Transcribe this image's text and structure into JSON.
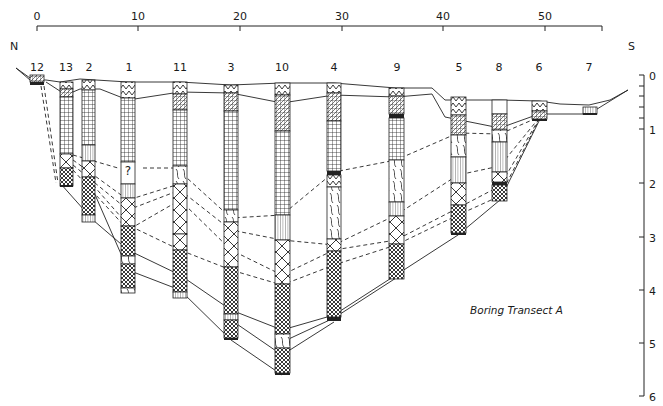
{
  "title": "Boring Transect A",
  "directions": {
    "north": "N",
    "south": "S"
  },
  "distance_scale": {
    "ticks": [
      {
        "label": "0",
        "x": 37
      },
      {
        "label": "10",
        "x": 138
      },
      {
        "label": "20",
        "x": 240
      },
      {
        "label": "30",
        "x": 342
      },
      {
        "label": "40",
        "x": 443
      },
      {
        "label": "50",
        "x": 545
      }
    ],
    "end_x": 602
  },
  "depth_scale": {
    "ticks": [
      {
        "label": "0",
        "y": 75
      },
      {
        "label": "1",
        "y": 129
      },
      {
        "label": "2",
        "y": 183
      },
      {
        "label": "3",
        "y": 237
      },
      {
        "label": "4",
        "y": 290
      },
      {
        "label": "5",
        "y": 343
      },
      {
        "label": "6",
        "y": 396
      }
    ]
  },
  "borings": [
    {
      "id": "12",
      "x": 37,
      "top": 75,
      "bottom": 87,
      "label_x": 37
    },
    {
      "id": "13",
      "x": 66,
      "top": 82,
      "bottom": 187,
      "label_x": 66
    },
    {
      "id": "2",
      "x": 88,
      "top": 80,
      "bottom": 222,
      "label_x": 89
    },
    {
      "id": "1",
      "x": 128,
      "top": 82,
      "bottom": 293,
      "label_x": 129
    },
    {
      "id": "11",
      "x": 180,
      "top": 82,
      "bottom": 298,
      "label_x": 180
    },
    {
      "id": "3",
      "x": 231,
      "top": 85,
      "bottom": 340,
      "label_x": 231
    },
    {
      "id": "10",
      "x": 282,
      "top": 83,
      "bottom": 375,
      "label_x": 282
    },
    {
      "id": "4",
      "x": 334,
      "top": 83,
      "bottom": 321,
      "label_x": 334
    },
    {
      "id": "9",
      "x": 396,
      "top": 88,
      "bottom": 279,
      "label_x": 397
    },
    {
      "id": "5",
      "x": 458,
      "top": 97,
      "bottom": 235,
      "label_x": 459
    },
    {
      "id": "8",
      "x": 500,
      "top": 100,
      "bottom": 202,
      "label_x": 499
    },
    {
      "id": "6",
      "x": 539,
      "top": 101,
      "bottom": 121,
      "label_x": 539
    },
    {
      "id": "7",
      "x": 589,
      "top": 106,
      "bottom": 116,
      "label_x": 589
    }
  ],
  "uncertain_marker": "?"
}
